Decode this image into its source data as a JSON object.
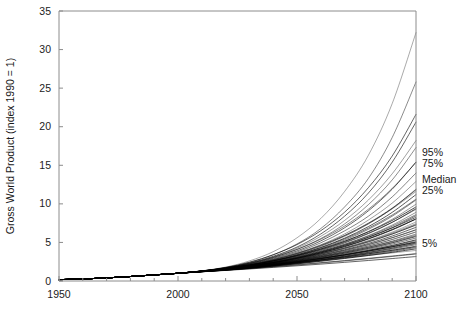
{
  "chart_data": {
    "type": "line",
    "title": "",
    "xlabel": "",
    "ylabel": "Gross World Product  (index 1990 = 1)",
    "xlim": [
      1950,
      2100
    ],
    "ylim": [
      0,
      35
    ],
    "xticks": [
      1950,
      2000,
      2050,
      2100
    ],
    "xticklabels": [
      "1950",
      "2000",
      "2050",
      "2100"
    ],
    "xminor_tick_interval": 10,
    "yticks": [
      0,
      5,
      10,
      15,
      20,
      25,
      30,
      35
    ],
    "yticklabels": [
      "0",
      "5",
      "10",
      "15",
      "20",
      "25",
      "30",
      "35"
    ],
    "grid": false,
    "legend_position": "right-inline-annotations",
    "line_color": "#000000",
    "annotations": [
      {
        "label": "95%",
        "x": 2100,
        "y": 16.5
      },
      {
        "label": "75%",
        "x": 2100,
        "y": 15.2
      },
      {
        "label": "Median",
        "x": 2100,
        "y": 13.0
      },
      {
        "label": "25%",
        "x": 2100,
        "y": 11.7
      },
      {
        "label": "5%",
        "x": 2100,
        "y": 4.8
      }
    ],
    "x": [
      1950,
      1960,
      1970,
      1980,
      1990,
      2000,
      2010,
      2020,
      2030,
      2040,
      2050,
      2060,
      2070,
      2080,
      2090,
      2100
    ],
    "series": [
      {
        "name": "scenario-01",
        "values": [
          0.18,
          0.26,
          0.4,
          0.58,
          0.79,
          1.0,
          1.32,
          1.8,
          2.6,
          3.8,
          5.6,
          8.1,
          11.6,
          16.3,
          23.0,
          32.2
        ]
      },
      {
        "name": "scenario-02",
        "values": [
          0.18,
          0.26,
          0.4,
          0.58,
          0.79,
          1.0,
          1.3,
          1.72,
          2.4,
          3.4,
          4.8,
          6.8,
          9.6,
          13.3,
          18.6,
          25.8
        ]
      },
      {
        "name": "scenario-03",
        "values": [
          0.18,
          0.26,
          0.4,
          0.58,
          0.79,
          1.0,
          1.3,
          1.7,
          2.32,
          3.2,
          4.4,
          6.1,
          8.4,
          11.4,
          15.4,
          20.6
        ]
      },
      {
        "name": "scenario-04",
        "values": [
          0.18,
          0.26,
          0.4,
          0.58,
          0.79,
          1.0,
          1.29,
          1.68,
          2.25,
          3.05,
          4.1,
          5.5,
          7.4,
          9.9,
          13.1,
          17.3
        ]
      },
      {
        "name": "scenario-05",
        "values": [
          0.18,
          0.26,
          0.4,
          0.58,
          0.79,
          1.0,
          1.29,
          1.66,
          2.2,
          2.95,
          3.9,
          5.2,
          6.9,
          9.1,
          11.9,
          15.4
        ]
      },
      {
        "name": "scenario-06",
        "values": [
          0.18,
          0.26,
          0.4,
          0.58,
          0.79,
          1.0,
          1.28,
          1.64,
          2.16,
          2.86,
          3.75,
          4.95,
          6.5,
          8.4,
          10.9,
          14.0
        ]
      },
      {
        "name": "scenario-07",
        "values": [
          0.18,
          0.26,
          0.4,
          0.58,
          0.79,
          1.0,
          1.28,
          1.62,
          2.12,
          2.78,
          3.62,
          4.7,
          6.1,
          7.9,
          10.1,
          12.9
        ]
      },
      {
        "name": "scenario-08",
        "values": [
          0.18,
          0.26,
          0.4,
          0.58,
          0.79,
          1.0,
          1.28,
          1.61,
          2.08,
          2.7,
          3.5,
          4.5,
          5.8,
          7.4,
          9.4,
          11.9
        ]
      },
      {
        "name": "scenario-09",
        "values": [
          0.18,
          0.26,
          0.4,
          0.58,
          0.79,
          1.0,
          1.27,
          1.6,
          2.05,
          2.64,
          3.4,
          4.35,
          5.55,
          7.05,
          8.9,
          11.2
        ]
      },
      {
        "name": "scenario-10",
        "values": [
          0.18,
          0.26,
          0.4,
          0.58,
          0.79,
          1.0,
          1.27,
          1.59,
          2.02,
          2.58,
          3.3,
          4.2,
          5.3,
          6.7,
          8.4,
          10.5
        ]
      },
      {
        "name": "scenario-11",
        "values": [
          0.18,
          0.26,
          0.4,
          0.58,
          0.79,
          1.0,
          1.27,
          1.58,
          2.0,
          2.54,
          3.22,
          4.08,
          5.12,
          6.42,
          8.0,
          9.95
        ]
      },
      {
        "name": "scenario-12",
        "values": [
          0.18,
          0.26,
          0.4,
          0.58,
          0.79,
          1.0,
          1.26,
          1.57,
          1.97,
          2.49,
          3.14,
          3.95,
          4.93,
          6.14,
          7.6,
          9.4
        ]
      },
      {
        "name": "scenario-13",
        "values": [
          0.18,
          0.26,
          0.4,
          0.58,
          0.79,
          1.0,
          1.26,
          1.56,
          1.95,
          2.45,
          3.07,
          3.84,
          4.76,
          5.89,
          7.25,
          8.9
        ]
      },
      {
        "name": "scenario-14",
        "values": [
          0.18,
          0.26,
          0.4,
          0.58,
          0.79,
          1.0,
          1.26,
          1.55,
          1.93,
          2.41,
          3.0,
          3.73,
          4.6,
          5.66,
          6.92,
          8.45
        ]
      },
      {
        "name": "scenario-15",
        "values": [
          0.18,
          0.26,
          0.4,
          0.58,
          0.79,
          1.0,
          1.25,
          1.54,
          1.91,
          2.37,
          2.94,
          3.63,
          4.45,
          5.44,
          6.62,
          8.03
        ]
      },
      {
        "name": "scenario-16",
        "values": [
          0.18,
          0.26,
          0.4,
          0.58,
          0.79,
          1.0,
          1.25,
          1.53,
          1.89,
          2.33,
          2.88,
          3.54,
          4.31,
          5.24,
          6.34,
          7.65
        ]
      },
      {
        "name": "scenario-17",
        "values": [
          0.18,
          0.26,
          0.4,
          0.58,
          0.79,
          1.0,
          1.25,
          1.52,
          1.87,
          2.3,
          2.82,
          3.45,
          4.18,
          5.05,
          6.08,
          7.3
        ]
      },
      {
        "name": "scenario-18",
        "values": [
          0.18,
          0.26,
          0.4,
          0.58,
          0.79,
          1.0,
          1.24,
          1.51,
          1.85,
          2.26,
          2.76,
          3.36,
          4.05,
          4.87,
          5.83,
          6.96
        ]
      },
      {
        "name": "scenario-19",
        "values": [
          0.18,
          0.26,
          0.4,
          0.58,
          0.79,
          1.0,
          1.24,
          1.5,
          1.83,
          2.23,
          2.71,
          3.28,
          3.93,
          4.7,
          5.6,
          6.65
        ]
      },
      {
        "name": "scenario-20",
        "values": [
          0.18,
          0.26,
          0.4,
          0.58,
          0.79,
          1.0,
          1.24,
          1.49,
          1.81,
          2.2,
          2.66,
          3.2,
          3.82,
          4.54,
          5.38,
          6.36
        ]
      },
      {
        "name": "scenario-21",
        "values": [
          0.18,
          0.26,
          0.4,
          0.58,
          0.79,
          1.0,
          1.23,
          1.48,
          1.79,
          2.16,
          2.61,
          3.12,
          3.71,
          4.39,
          5.17,
          6.08
        ]
      },
      {
        "name": "scenario-22",
        "values": [
          0.18,
          0.26,
          0.4,
          0.58,
          0.79,
          1.0,
          1.23,
          1.47,
          1.77,
          2.13,
          2.56,
          3.05,
          3.61,
          4.24,
          4.97,
          5.82
        ]
      },
      {
        "name": "scenario-23",
        "values": [
          0.18,
          0.26,
          0.4,
          0.58,
          0.79,
          1.0,
          1.23,
          1.46,
          1.76,
          2.1,
          2.51,
          2.98,
          3.51,
          4.11,
          4.79,
          5.57
        ]
      },
      {
        "name": "scenario-24",
        "values": [
          0.18,
          0.26,
          0.4,
          0.58,
          0.79,
          1.0,
          1.22,
          1.45,
          1.74,
          2.07,
          2.47,
          2.91,
          3.41,
          3.98,
          4.61,
          5.34
        ]
      },
      {
        "name": "scenario-25",
        "values": [
          0.18,
          0.26,
          0.4,
          0.58,
          0.79,
          1.0,
          1.22,
          1.44,
          1.72,
          2.04,
          2.42,
          2.85,
          3.32,
          3.85,
          4.45,
          5.12
        ]
      },
      {
        "name": "scenario-26",
        "values": [
          0.18,
          0.26,
          0.4,
          0.58,
          0.79,
          1.0,
          1.22,
          1.44,
          1.71,
          2.02,
          2.38,
          2.78,
          3.23,
          3.73,
          4.29,
          4.91
        ]
      },
      {
        "name": "scenario-27",
        "values": [
          0.18,
          0.26,
          0.4,
          0.58,
          0.79,
          1.0,
          1.21,
          1.43,
          1.69,
          1.99,
          2.34,
          2.72,
          3.15,
          3.62,
          4.14,
          4.71
        ]
      },
      {
        "name": "scenario-28",
        "values": [
          0.18,
          0.26,
          0.4,
          0.58,
          0.79,
          1.0,
          1.21,
          1.42,
          1.68,
          1.96,
          2.3,
          2.67,
          3.07,
          3.51,
          3.99,
          4.52
        ]
      },
      {
        "name": "scenario-29",
        "values": [
          0.18,
          0.26,
          0.4,
          0.58,
          0.79,
          1.0,
          1.21,
          1.41,
          1.66,
          1.94,
          2.26,
          2.61,
          2.99,
          3.4,
          3.85,
          4.34
        ]
      },
      {
        "name": "scenario-30",
        "values": [
          0.18,
          0.26,
          0.4,
          0.58,
          0.79,
          1.0,
          1.2,
          1.4,
          1.65,
          1.92,
          2.22,
          2.56,
          2.92,
          3.3,
          3.72,
          4.17
        ]
      },
      {
        "name": "scenario-31",
        "values": [
          0.18,
          0.26,
          0.4,
          0.58,
          0.79,
          1.0,
          1.22,
          1.46,
          1.74,
          2.04,
          2.36,
          2.68,
          3.0,
          3.32,
          3.64,
          3.96
        ]
      },
      {
        "name": "scenario-32",
        "values": [
          0.18,
          0.26,
          0.4,
          0.58,
          0.79,
          1.0,
          1.2,
          1.39,
          1.6,
          1.83,
          2.07,
          2.33,
          2.6,
          2.88,
          3.18,
          3.5
        ]
      },
      {
        "name": "scenario-33",
        "values": [
          0.18,
          0.26,
          0.4,
          0.58,
          0.79,
          1.0,
          1.19,
          1.37,
          1.56,
          1.76,
          1.97,
          2.19,
          2.42,
          2.66,
          2.91,
          3.17
        ]
      },
      {
        "name": "scenario-34",
        "values": [
          0.18,
          0.26,
          0.4,
          0.58,
          0.79,
          1.0,
          1.24,
          1.5,
          1.8,
          2.14,
          2.52,
          2.94,
          3.4,
          3.9,
          4.44,
          5.02
        ]
      },
      {
        "name": "scenario-35",
        "values": [
          0.18,
          0.26,
          0.4,
          0.58,
          0.79,
          1.0,
          1.26,
          1.56,
          1.94,
          2.42,
          3.02,
          3.76,
          4.64,
          5.68,
          6.88,
          8.25
        ]
      },
      {
        "name": "scenario-36",
        "values": [
          0.18,
          0.26,
          0.4,
          0.58,
          0.79,
          1.0,
          1.28,
          1.63,
          2.1,
          2.74,
          3.56,
          4.6,
          5.9,
          7.5,
          9.45,
          11.8
        ]
      },
      {
        "name": "scenario-37",
        "values": [
          0.18,
          0.26,
          0.4,
          0.58,
          0.79,
          1.0,
          1.29,
          1.69,
          2.28,
          3.12,
          4.26,
          5.8,
          7.85,
          10.5,
          13.9,
          18.2
        ]
      },
      {
        "name": "scenario-38",
        "values": [
          0.18,
          0.26,
          0.4,
          0.58,
          0.79,
          1.0,
          1.27,
          1.6,
          2.04,
          2.62,
          3.36,
          4.3,
          5.45,
          6.85,
          8.55,
          10.6
        ]
      },
      {
        "name": "scenario-39",
        "values": [
          0.18,
          0.26,
          0.4,
          0.58,
          0.79,
          1.0,
          1.26,
          1.55,
          1.92,
          2.38,
          2.96,
          3.66,
          4.5,
          5.5,
          6.68,
          8.05
        ]
      },
      {
        "name": "scenario-40",
        "values": [
          0.18,
          0.26,
          0.4,
          0.58,
          0.79,
          1.0,
          1.25,
          1.54,
          1.9,
          2.34,
          2.87,
          3.5,
          4.24,
          5.1,
          6.1,
          7.24
        ]
      },
      {
        "name": "scenario-41",
        "values": [
          0.18,
          0.26,
          0.4,
          0.58,
          0.79,
          1.0,
          1.24,
          1.52,
          1.86,
          2.27,
          2.75,
          3.32,
          3.98,
          4.74,
          5.62,
          6.62
        ]
      },
      {
        "name": "scenario-42",
        "values": [
          0.18,
          0.26,
          0.4,
          0.58,
          0.79,
          1.0,
          1.23,
          1.49,
          1.8,
          2.16,
          2.58,
          3.06,
          3.61,
          4.24,
          4.95,
          5.76
        ]
      },
      {
        "name": "scenario-43",
        "values": [
          0.18,
          0.26,
          0.4,
          0.58,
          0.79,
          1.0,
          1.22,
          1.47,
          1.76,
          2.09,
          2.47,
          2.9,
          3.39,
          3.94,
          4.56,
          5.26
        ]
      },
      {
        "name": "scenario-44",
        "values": [
          0.18,
          0.26,
          0.4,
          0.58,
          0.79,
          1.0,
          1.21,
          1.45,
          1.72,
          2.03,
          2.38,
          2.77,
          3.21,
          3.7,
          4.25,
          4.86
        ]
      },
      {
        "name": "scenario-45",
        "values": [
          0.18,
          0.26,
          0.4,
          0.58,
          0.79,
          1.0,
          1.27,
          1.62,
          2.06,
          2.62,
          3.3,
          4.14,
          5.15,
          6.38,
          7.85,
          9.6
        ]
      },
      {
        "name": "scenario-46",
        "values": [
          0.18,
          0.26,
          0.4,
          0.58,
          0.79,
          1.0,
          1.28,
          1.65,
          2.14,
          2.78,
          3.6,
          4.62,
          5.9,
          7.46,
          9.35,
          11.6
        ]
      },
      {
        "name": "scenario-47",
        "values": [
          0.18,
          0.26,
          0.4,
          0.58,
          0.79,
          1.0,
          1.29,
          1.71,
          2.28,
          3.06,
          4.08,
          5.42,
          7.12,
          9.3,
          12.0,
          15.4
        ]
      },
      {
        "name": "scenario-48",
        "values": [
          0.18,
          0.26,
          0.4,
          0.58,
          0.79,
          1.0,
          1.3,
          1.76,
          2.44,
          3.4,
          4.72,
          6.52,
          8.92,
          12.1,
          16.2,
          21.6
        ]
      },
      {
        "name": "scenario-49",
        "values": [
          0.18,
          0.26,
          0.4,
          0.58,
          0.79,
          1.0,
          1.24,
          1.51,
          1.84,
          2.22,
          2.66,
          3.16,
          3.73,
          4.37,
          5.1,
          5.92
        ]
      },
      {
        "name": "scenario-50",
        "values": [
          0.18,
          0.26,
          0.4,
          0.58,
          0.79,
          1.0,
          1.23,
          1.48,
          1.78,
          2.12,
          2.5,
          2.92,
          3.38,
          3.88,
          4.43,
          5.02
        ]
      },
      {
        "name": "scenario-51",
        "values": [
          0.18,
          0.26,
          0.4,
          0.58,
          0.79,
          1.0,
          1.26,
          1.58,
          1.98,
          2.48,
          3.09,
          3.84,
          4.74,
          5.82,
          7.1,
          8.6
        ]
      },
      {
        "name": "scenario-52",
        "values": [
          0.18,
          0.26,
          0.4,
          0.58,
          0.79,
          1.0,
          1.25,
          1.55,
          1.92,
          2.36,
          2.9,
          3.54,
          4.3,
          5.18,
          6.22,
          7.42
        ]
      },
      {
        "name": "scenario-53",
        "values": [
          0.18,
          0.26,
          0.4,
          0.58,
          0.79,
          1.0,
          1.27,
          1.61,
          2.04,
          2.58,
          3.24,
          4.04,
          5.02,
          6.2,
          7.62,
          9.3
        ]
      },
      {
        "name": "scenario-54",
        "values": [
          0.18,
          0.26,
          0.4,
          0.58,
          0.79,
          1.0,
          1.22,
          1.46,
          1.73,
          2.03,
          2.36,
          2.72,
          3.11,
          3.53,
          3.98,
          4.46
        ]
      },
      {
        "name": "scenario-55",
        "values": [
          0.18,
          0.26,
          0.4,
          0.58,
          0.79,
          1.0,
          1.2,
          1.41,
          1.63,
          1.87,
          2.12,
          2.38,
          2.65,
          2.94,
          3.24,
          3.55
        ]
      }
    ]
  }
}
